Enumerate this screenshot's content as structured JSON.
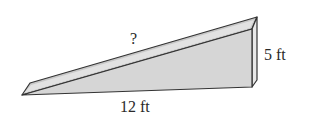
{
  "diagram": {
    "type": "right-triangle-ramp",
    "labels": {
      "hypotenuse": "?",
      "height": "5 ft",
      "base": "12 ft"
    },
    "colors": {
      "front_face": "#d9d9d9",
      "top_face": "#c4c4c4",
      "side_face": "#e6e6e6",
      "edge": "#333333"
    }
  }
}
